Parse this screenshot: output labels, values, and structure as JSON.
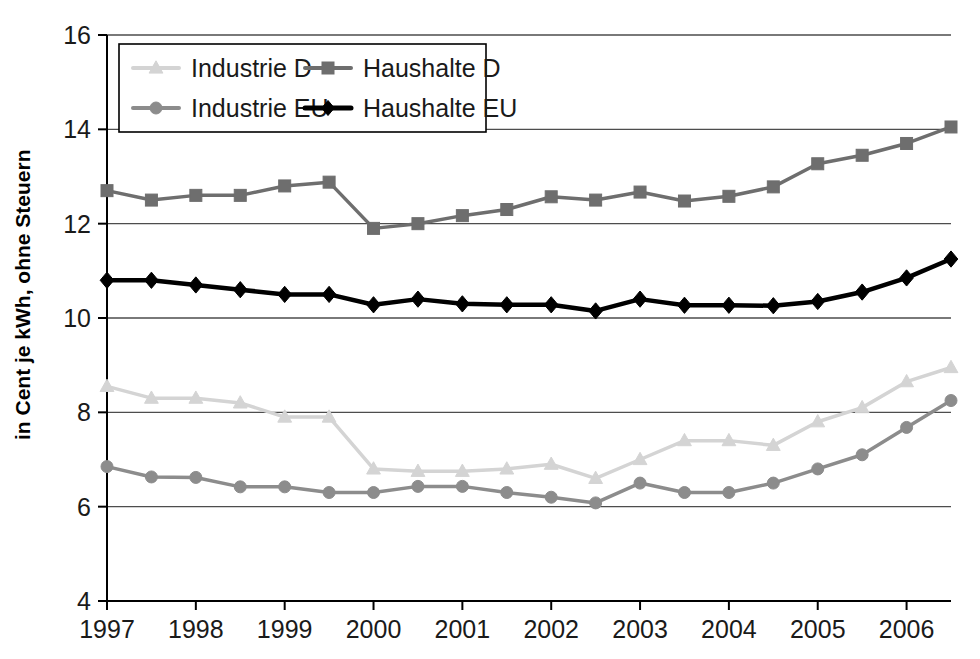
{
  "chart_data": {
    "type": "line",
    "title": "",
    "subtitle": "",
    "xlabel": "",
    "ylabel": "in Cent je kWh, ohne Steuern",
    "ylim": [
      4,
      16
    ],
    "ytick_step": 2,
    "yticks": [
      "16",
      "14",
      "12",
      "10",
      "8",
      "6",
      "4"
    ],
    "xticks": [
      "1997",
      "1998",
      "1999",
      "2000",
      "2001",
      "2002",
      "2003",
      "2004",
      "2005",
      "2006"
    ],
    "xlim": [
      1997,
      2006.5
    ],
    "x": [
      1997,
      1997.5,
      1998,
      1998.5,
      1999,
      1999.5,
      2000,
      2000.5,
      2001,
      2001.5,
      2002,
      2002.5,
      2003,
      2003.5,
      2004,
      2004.5,
      2005,
      2005.5,
      2006,
      2006.5
    ],
    "grid": "horizontal",
    "legend_position": "top-left-inside",
    "series": [
      {
        "name": "Industrie D",
        "color": "#d4d4d4",
        "marker": "triangle",
        "values": [
          8.55,
          8.3,
          8.3,
          8.2,
          7.9,
          7.9,
          6.8,
          6.75,
          6.75,
          6.8,
          6.9,
          6.6,
          7.0,
          7.4,
          7.4,
          7.3,
          7.8,
          8.1,
          8.65,
          8.95
        ]
      },
      {
        "name": "Haushalte D",
        "color": "#6e6e6e",
        "marker": "square",
        "values": [
          12.7,
          12.5,
          12.6,
          12.6,
          12.8,
          12.88,
          11.9,
          12.0,
          12.17,
          12.3,
          12.57,
          12.5,
          12.67,
          12.48,
          12.58,
          12.78,
          13.27,
          13.45,
          13.7,
          14.05
        ]
      },
      {
        "name": "Industrie EU",
        "color": "#8c8c8c",
        "marker": "circle",
        "values": [
          6.85,
          6.63,
          6.62,
          6.42,
          6.42,
          6.3,
          6.3,
          6.43,
          6.43,
          6.3,
          6.2,
          6.08,
          6.5,
          6.3,
          6.3,
          6.5,
          6.8,
          7.1,
          7.68,
          8.25
        ]
      },
      {
        "name": "Haushalte EU",
        "color": "#000000",
        "marker": "diamond",
        "values": [
          10.8,
          10.8,
          10.7,
          10.6,
          10.5,
          10.5,
          10.28,
          10.4,
          10.3,
          10.28,
          10.28,
          10.15,
          10.4,
          10.27,
          10.27,
          10.26,
          10.35,
          10.55,
          10.85,
          11.25
        ]
      }
    ]
  },
  "legend": {
    "items": [
      {
        "label": "Industrie D"
      },
      {
        "label": "Haushalte D"
      },
      {
        "label": "Industrie EU"
      },
      {
        "label": "Haushalte EU"
      }
    ]
  }
}
